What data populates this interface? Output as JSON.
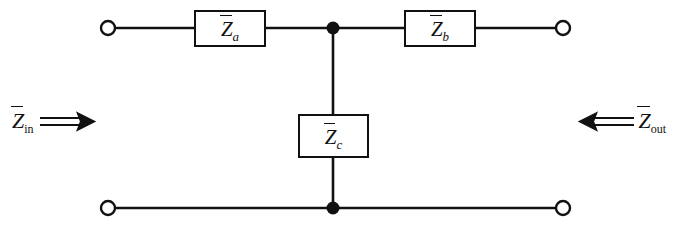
{
  "figure": {
    "type": "two-port-T-network-circuit-diagram",
    "background_color": "#ffffff",
    "line_color": "#111111",
    "width": 674,
    "height": 226
  },
  "components": {
    "series_left": {
      "name": "impedance-box-za",
      "symbol": "Z",
      "subscript": "a",
      "overbar": true,
      "branch": "series-top-left"
    },
    "series_right": {
      "name": "impedance-box-zb",
      "symbol": "Z",
      "subscript": "b",
      "overbar": true,
      "branch": "series-top-right"
    },
    "shunt": {
      "name": "impedance-box-zc",
      "symbol": "Z",
      "subscript": "c",
      "overbar": true,
      "branch": "shunt-center"
    }
  },
  "ports": {
    "input": {
      "symbol": "Z",
      "subscript": "in",
      "overbar": true,
      "arrow": "double-arrow-right",
      "arrow_glyph": "⟹",
      "direction": "into-network",
      "side": "left"
    },
    "output": {
      "symbol": "Z",
      "subscript": "out",
      "overbar": true,
      "arrow": "double-arrow-left",
      "arrow_glyph": "⟸",
      "direction": "into-network",
      "side": "right"
    }
  },
  "terminals": [
    {
      "name": "terminal-input-top",
      "style": "open-circle",
      "x": 108,
      "y": 28
    },
    {
      "name": "terminal-output-top",
      "style": "open-circle",
      "x": 563,
      "y": 28
    },
    {
      "name": "terminal-input-bottom",
      "style": "open-circle",
      "x": 108,
      "y": 208
    },
    {
      "name": "terminal-output-bottom",
      "style": "open-circle",
      "x": 563,
      "y": 208
    }
  ],
  "junctions": [
    {
      "name": "junction-node-top",
      "style": "filled-dot",
      "x": 333,
      "y": 28
    },
    {
      "name": "junction-node-bottom",
      "style": "filled-dot",
      "x": 333,
      "y": 208
    }
  ]
}
